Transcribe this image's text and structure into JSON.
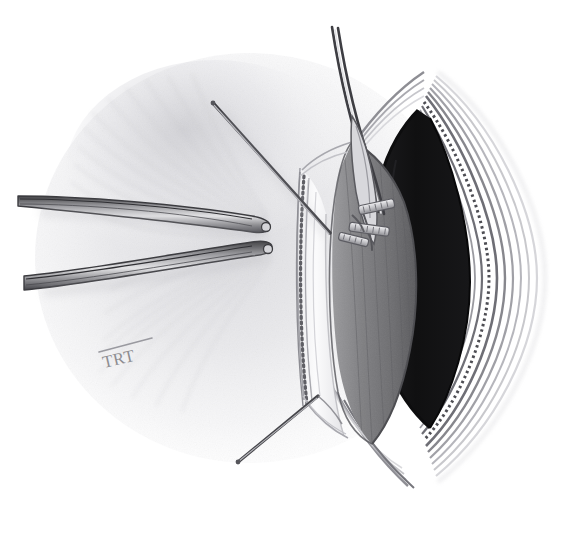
{
  "figure": {
    "medium": "graphite pencil drawing",
    "background_color": "#ffffff",
    "width": 585,
    "height": 533,
    "artist_signature": "TRT"
  },
  "palette": {
    "paper": "#ffffff",
    "soft_shade": "#e9e9eb",
    "mid_shade": "#cfcfd2",
    "tissue_gray": "#8c8c8f",
    "muscle_gray": "#7a7a7d",
    "deep_shadow": "#2a2a2c",
    "cavity_black": "#131314",
    "instrument_steel": "#6c6c70",
    "instrument_edge": "#3d3d40",
    "clip_metal": "#b9b9bc",
    "line_ink": "#5a5a5e",
    "signature_gray": "#8d8d90"
  },
  "elements": {
    "skin_field": {
      "name": "Retracted skin and subcutaneous field",
      "description": "Soft radial pencil shading forming the broad tissue surface on the left two-thirds of the plate"
    },
    "wound": {
      "name": "Longitudinal incision",
      "description": "Vertically elongated lens-shaped opening with superior and inferior apices",
      "cavity_label": "Deep wound cavity (unlit interior)"
    },
    "tissue_layers": {
      "name": "Layered wound margin",
      "description": "Concentric curving lines along the right wound edge representing fascia, muscle and subcutaneous layers",
      "layer_count": 7
    },
    "fascia_flap": {
      "name": "Reflected fascial flap",
      "description": "Pale flap in the mid-line bearing a stippled cut margin"
    },
    "cut_margin": {
      "name": "Stippled cut margin",
      "description": "Dotted line marking the divided fascial edge"
    },
    "muscle_belly": {
      "name": "Exposed muscle belly",
      "description": "Elongated mid-gray textured structure inside the wound"
    }
  },
  "instruments": [
    {
      "id": "retractor-upper-left",
      "label": "Upper retractor blade",
      "description": "Slender blunt-tipped blade entering from the left, tip at the wound margin"
    },
    {
      "id": "retractor-lower-left",
      "label": "Lower retractor blade",
      "description": "Second slender blunt-tipped blade entering from the lower left"
    },
    {
      "id": "probe-upper-diagonal",
      "label": "Upper oblique probe",
      "description": "Thin straight shaft running from upper left down to the wound margin"
    },
    {
      "id": "forceps-top",
      "label": "Vertical forceps / dissector",
      "description": "Narrow double-lined instrument descending from the top of the plate into the wound"
    },
    {
      "id": "needle-lower",
      "label": "Lower oblique needle",
      "description": "Thin shaft running from the lower wound apex toward the lower left"
    }
  ],
  "clips": {
    "label": "Vessel clips",
    "count": 3,
    "description": "Small ladder-like metal clips applied across a vessel on the muscle surface"
  },
  "signature": {
    "text": "TRT",
    "position": "lower left of the drawing",
    "style": "hand-lettered monogram with overbar"
  }
}
